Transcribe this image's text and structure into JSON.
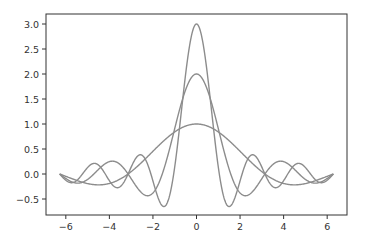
{
  "chart_data": {
    "type": "line",
    "title": "",
    "xlabel": "",
    "ylabel": "",
    "xlim": [
      -6.91,
      6.91
    ],
    "ylim": [
      -0.82,
      3.2
    ],
    "grid": false,
    "legend": null,
    "x_ticks": [
      -6,
      -4,
      -2,
      0,
      2,
      4,
      6
    ],
    "x_tick_labels": [
      "−6",
      "−4",
      "−2",
      "0",
      "2",
      "4",
      "6"
    ],
    "y_ticks": [
      -0.5,
      0.0,
      0.5,
      1.0,
      1.5,
      2.0,
      2.5,
      3.0
    ],
    "y_tick_labels": [
      "−0.5",
      "0.0",
      "0.5",
      "1.0",
      "1.5",
      "2.0",
      "2.5",
      "3.0"
    ],
    "x_domain": [
      -6.2832,
      6.2832
    ],
    "series": [
      {
        "name": "sin(x)/x",
        "k": 1,
        "peak": 1.0,
        "color": "#8c8c8c"
      },
      {
        "name": "sin(2x)/x",
        "k": 2,
        "peak": 2.0,
        "color": "#8c8c8c"
      },
      {
        "name": "sin(3x)/x",
        "k": 3,
        "peak": 3.0,
        "color": "#8c8c8c"
      }
    ],
    "sample_points": {
      "x": [
        -6.28,
        -4.71,
        -3.14,
        -1.57,
        0,
        1.57,
        3.14,
        4.71,
        6.28
      ],
      "sin(x)/x": [
        0.0,
        -0.21,
        0.0,
        0.64,
        1.0,
        0.64,
        0.0,
        -0.21,
        0.0
      ],
      "sin(2x)/x": [
        0.0,
        0.0,
        0.0,
        0.0,
        2.0,
        0.0,
        0.0,
        0.0,
        0.0
      ],
      "sin(3x)/x": [
        0.0,
        0.21,
        0.0,
        -0.64,
        3.0,
        -0.64,
        0.0,
        0.21,
        0.0
      ]
    }
  },
  "colors": {
    "axes": "#333333",
    "line": "#8c8c8c",
    "background": "#ffffff"
  }
}
